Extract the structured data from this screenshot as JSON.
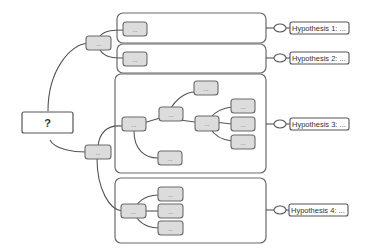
{
  "root": {
    "label": "?"
  },
  "node_placeholder": "...",
  "hypotheses": [
    {
      "label": "Hypothesis 1: ..."
    },
    {
      "label": "Hypothesis 2: ..."
    },
    {
      "label": "Hypothesis 3: ..."
    },
    {
      "label": "Hypothesis 4: ..."
    }
  ],
  "colors": {
    "node_fill": "#dcdcdc",
    "stroke": "#555555",
    "background": "#ffffff"
  }
}
